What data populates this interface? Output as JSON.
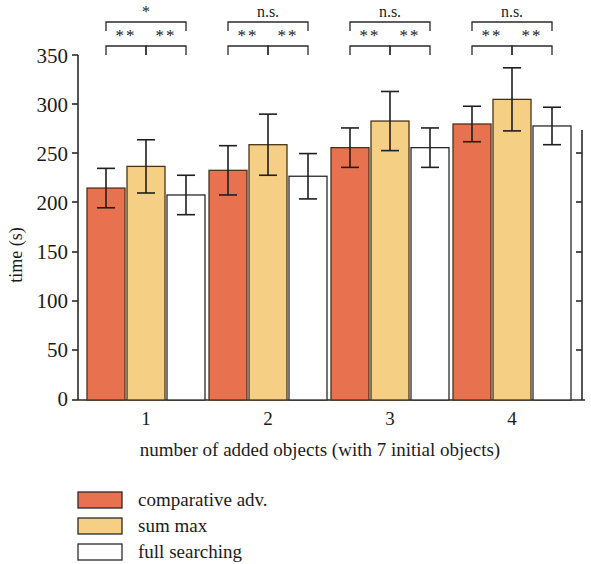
{
  "chart_data": {
    "type": "bar",
    "title": "",
    "subtitle": "",
    "xlabel": "number of added objects (with 7 initial objects)",
    "ylabel": "time (s)",
    "categories": [
      "1",
      "2",
      "3",
      "4"
    ],
    "ylim": [
      0,
      350
    ],
    "yticks": [
      0,
      50,
      100,
      150,
      200,
      250,
      300,
      350
    ],
    "ytick_labels": [
      "0",
      "50",
      "100",
      "150",
      "200",
      "250",
      "300",
      "350"
    ],
    "grid": false,
    "legend_position": "below-axes-left",
    "series": [
      {
        "name": "comparative adv.",
        "color": "#e8714f",
        "values": [
          215,
          233,
          256,
          280
        ],
        "errors": [
          20,
          25,
          20,
          18
        ]
      },
      {
        "name": "sum max",
        "color": "#f5cf84",
        "values": [
          237,
          259,
          283,
          305
        ],
        "errors": [
          27,
          31,
          30,
          32
        ]
      },
      {
        "name": "full searching",
        "color": "#ffffff",
        "values": [
          208,
          227,
          256,
          278
        ],
        "errors": [
          20,
          23,
          20,
          19
        ]
      }
    ],
    "annotations": [
      {
        "group": "1",
        "outer": "*",
        "inner_left": "**",
        "inner_right": "**"
      },
      {
        "group": "2",
        "outer": "n.s.",
        "inner_left": "**",
        "inner_right": "**"
      },
      {
        "group": "3",
        "outer": "n.s.",
        "inner_left": "**",
        "inner_right": "**"
      },
      {
        "group": "4",
        "outer": "n.s.",
        "inner_left": "**",
        "inner_right": "**"
      }
    ]
  },
  "axes": {
    "y_title": "time (s)",
    "x_title": "number of added objects (with 7 initial objects)",
    "y_tick_0": "0",
    "y_tick_50": "50",
    "y_tick_100": "100",
    "y_tick_150": "150",
    "y_tick_200": "200",
    "y_tick_250": "250",
    "y_tick_300": "300",
    "y_tick_350": "350",
    "x_tick_1": "1",
    "x_tick_2": "2",
    "x_tick_3": "3",
    "x_tick_4": "4"
  },
  "significance": {
    "g1_outer": "*",
    "g1_left": "**",
    "g1_right": "**",
    "g2_outer": "n.s.",
    "g2_left": "**",
    "g2_right": "**",
    "g3_outer": "n.s.",
    "g3_left": "**",
    "g3_right": "**",
    "g4_outer": "n.s.",
    "g4_left": "**",
    "g4_right": "**"
  },
  "legend": {
    "items": [
      {
        "label": "comparative adv.",
        "color": "#e8714f"
      },
      {
        "label": "sum max",
        "color": "#f5cf84"
      },
      {
        "label": "full searching",
        "color": "#ffffff"
      }
    ]
  },
  "colors": {
    "series_1": "#e8714f",
    "series_2": "#f5cf84",
    "series_3": "#ffffff",
    "axis": "#2a2a2a",
    "bar_outline": "#4a3418",
    "background": "#ffffff"
  }
}
